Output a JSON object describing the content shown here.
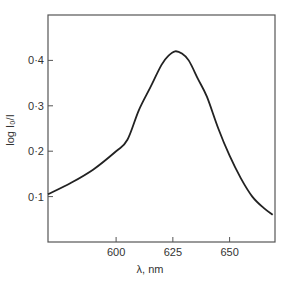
{
  "chart_data": {
    "type": "line",
    "title": "",
    "xlabel": "λ, nm",
    "ylabel": "log I₀/I",
    "xlim": [
      570,
      670
    ],
    "ylim": [
      0.0,
      0.5
    ],
    "grid": false,
    "legend": null,
    "x_ticks": [
      600,
      625,
      650
    ],
    "x_tick_labels": [
      "600",
      "625",
      "650"
    ],
    "y_ticks": [
      0.1,
      0.2,
      0.3,
      0.4
    ],
    "y_tick_labels": [
      "0·1",
      "0·2",
      "0·3",
      "0·4"
    ],
    "series": [
      {
        "name": "absorbance",
        "x": [
          570,
          580,
          590,
          600,
          605,
          610,
          615,
          620,
          623,
          626,
          629,
          632,
          636,
          640,
          645,
          650,
          655,
          660,
          665,
          669
        ],
        "y": [
          0.105,
          0.13,
          0.16,
          0.2,
          0.225,
          0.29,
          0.34,
          0.39,
          0.41,
          0.42,
          0.415,
          0.4,
          0.36,
          0.32,
          0.25,
          0.19,
          0.14,
          0.1,
          0.075,
          0.06
        ]
      }
    ]
  },
  "axes": {
    "xlabel": "λ, nm",
    "ylabel": "log I₀/I"
  }
}
